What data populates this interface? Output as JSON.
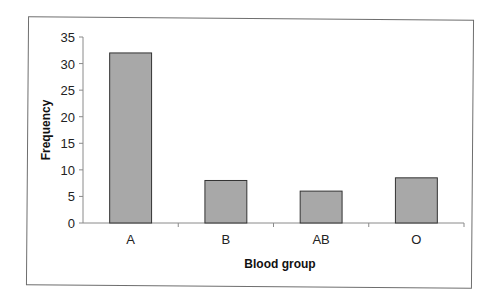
{
  "chart_data": {
    "type": "bar",
    "title": "",
    "xlabel": "Blood group",
    "ylabel": "Frequency",
    "categories": [
      "A",
      "B",
      "AB",
      "O"
    ],
    "values": [
      32,
      8,
      6,
      8.5
    ],
    "ylim": [
      0,
      35
    ],
    "yticks": [
      0,
      5,
      10,
      15,
      20,
      25,
      30,
      35
    ],
    "grid": false,
    "legend": null,
    "bar_color": "#a8a8a8",
    "bar_edge_color": "#333333"
  }
}
